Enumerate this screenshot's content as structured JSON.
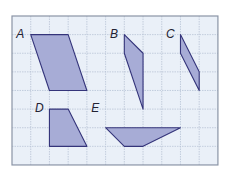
{
  "diagram": {
    "type": "grid-shapes",
    "grid": {
      "cols": 11,
      "rows": 8,
      "origin_x": 12,
      "origin_y": 16,
      "cell_w": 18.72,
      "cell_h": 18.62
    },
    "colors": {
      "background": "#eaf0f8",
      "grid_line": "#b9c4d6",
      "border": "#8a94a6",
      "shape_fill": "#a7acd6",
      "shape_stroke": "#34347a"
    },
    "shapes": [
      {
        "label": "A",
        "points": [
          [
            1,
            1
          ],
          [
            3,
            1
          ],
          [
            4,
            4
          ],
          [
            2,
            4
          ]
        ],
        "label_pos": [
          0.55,
          1.05
        ]
      },
      {
        "label": "B",
        "points": [
          [
            6,
            1
          ],
          [
            7,
            2
          ],
          [
            7,
            5
          ],
          [
            6,
            2
          ]
        ],
        "label_pos": [
          5.55,
          1.05
        ]
      },
      {
        "label": "C",
        "points": [
          [
            9,
            1
          ],
          [
            10,
            3
          ],
          [
            10,
            4
          ],
          [
            9,
            2
          ]
        ],
        "label_pos": [
          8.55,
          1.05
        ]
      },
      {
        "label": "D",
        "points": [
          [
            2,
            5
          ],
          [
            3,
            5
          ],
          [
            4,
            7
          ],
          [
            2,
            7
          ]
        ],
        "label_pos": [
          1.55,
          5.05
        ]
      },
      {
        "label": "E",
        "points": [
          [
            5,
            6
          ],
          [
            9,
            6
          ],
          [
            7,
            7
          ],
          [
            6,
            7
          ]
        ],
        "label_pos": [
          4.55,
          5.05
        ]
      }
    ]
  }
}
